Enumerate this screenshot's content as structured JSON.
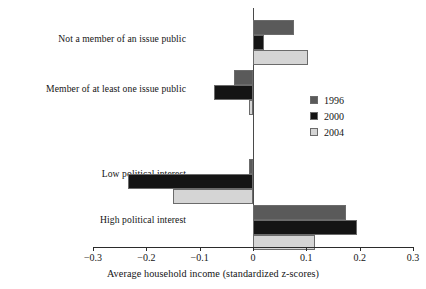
{
  "chart_data": {
    "type": "bar",
    "orientation": "horizontal",
    "title": "",
    "xlabel": "Average household income (standardized z-scores)",
    "ylabel": "",
    "xlim": [
      -0.3,
      0.3
    ],
    "xticks": [
      -0.3,
      -0.2,
      -0.1,
      0,
      0.1,
      0.2,
      0.3
    ],
    "xticklabels": [
      "−0.3",
      "−0.2",
      "−0.1",
      "0",
      "0.1",
      "0.2",
      "0.3"
    ],
    "grid": false,
    "legend_position": "center-right",
    "categories": [
      "Not a member of an issue public",
      "Member of at least one issue public",
      "Low political interest",
      "High political interest"
    ],
    "series": [
      {
        "name": "1996",
        "color": "#5a5a5a",
        "values": [
          0.077,
          -0.035,
          -0.008,
          0.175
        ]
      },
      {
        "name": "2000",
        "color": "#141414",
        "values": [
          0.02,
          -0.073,
          -0.235,
          0.195
        ]
      },
      {
        "name": "2004",
        "color": "#d5d5d5",
        "values": [
          0.103,
          -0.008,
          -0.15,
          0.117
        ]
      }
    ]
  },
  "axis": {
    "zero_label": "0",
    "baseline_color": "#2b2b2b"
  },
  "legend": {
    "entries": [
      {
        "label": "1996",
        "color": "#5a5a5a"
      },
      {
        "label": "2000",
        "color": "#141414"
      },
      {
        "label": "2004",
        "color": "#d5d5d5"
      }
    ]
  }
}
